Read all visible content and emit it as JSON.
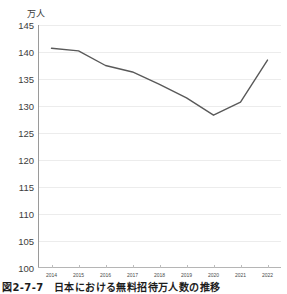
{
  "chart_data": {
    "type": "line",
    "title": "",
    "subtitle": "",
    "xlabel": "",
    "ylabel": "万人",
    "unit_label": "万人",
    "categories": [
      "2014",
      "2015",
      "2016",
      "2017",
      "2018",
      "2019",
      "2020",
      "2021",
      "2022"
    ],
    "x": [
      "2014",
      "2015",
      "2016",
      "2017",
      "2018",
      "2019",
      "2020",
      "2021",
      "2022"
    ],
    "values": [
      140.7,
      140.2,
      137.5,
      136.3,
      134.0,
      131.5,
      128.3,
      130.7,
      138.5
    ],
    "series": [
      {
        "name": "無料招待者数",
        "values": [
          140.7,
          140.2,
          137.5,
          136.3,
          134.0,
          131.5,
          128.3,
          130.7,
          138.5
        ],
        "color": "#595959"
      }
    ],
    "ylim": [
      100,
      145
    ],
    "yticks": [
      100,
      105,
      110,
      115,
      120,
      125,
      130,
      135,
      140,
      145
    ],
    "ytick_labels": [
      "100",
      "105",
      "110",
      "115",
      "120",
      "125",
      "130",
      "135",
      "140",
      "145"
    ],
    "xtick_labels": [
      "2014",
      "2015",
      "2016",
      "2017",
      "2018",
      "2019",
      "2020",
      "2021",
      "2022"
    ],
    "grid": true,
    "grid_axis": "y",
    "legend": false,
    "legend_position": "none",
    "line_color": "#595959",
    "line_width": 1.4,
    "markers": false,
    "background_color": "#ffffff",
    "grid_color": "#ececec",
    "axis_color": "#9a9a9a",
    "text_color": "#3d3d3d",
    "annotations": []
  },
  "caption": {
    "text": "図2-7-7　日本における無料招待万人数の推移"
  }
}
